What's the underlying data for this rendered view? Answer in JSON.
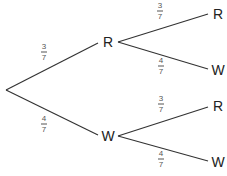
{
  "diagram": {
    "type": "probability-tree",
    "root": {
      "x": 6,
      "y": 90
    },
    "level1": [
      {
        "label": "R",
        "x": 108,
        "y": 42,
        "branch_prob": {
          "numerator": "3",
          "denominator": "7"
        },
        "prob_label_pos": {
          "x": 44,
          "y": 52
        },
        "children": [
          {
            "label": "R",
            "x": 218,
            "y": 13,
            "branch_prob": {
              "numerator": "3",
              "denominator": "7"
            },
            "prob_label_pos": {
              "x": 160,
              "y": 10
            }
          },
          {
            "label": "W",
            "x": 218,
            "y": 70,
            "branch_prob": {
              "numerator": "4",
              "denominator": "7"
            },
            "prob_label_pos": {
              "x": 161,
              "y": 65
            }
          }
        ]
      },
      {
        "label": "W",
        "x": 108,
        "y": 136,
        "branch_prob": {
          "numerator": "4",
          "denominator": "7"
        },
        "prob_label_pos": {
          "x": 44,
          "y": 124
        },
        "children": [
          {
            "label": "R",
            "x": 218,
            "y": 106,
            "branch_prob": {
              "numerator": "3",
              "denominator": "7"
            },
            "prob_label_pos": {
              "x": 161,
              "y": 104
            }
          },
          {
            "label": "W",
            "x": 218,
            "y": 162,
            "branch_prob": {
              "numerator": "4",
              "denominator": "7"
            },
            "prob_label_pos": {
              "x": 161,
              "y": 158
            }
          }
        ]
      }
    ]
  },
  "colors": {
    "line": "#333333",
    "node_text": "#222222",
    "fraction_text": "#555555",
    "background": "#ffffff"
  }
}
